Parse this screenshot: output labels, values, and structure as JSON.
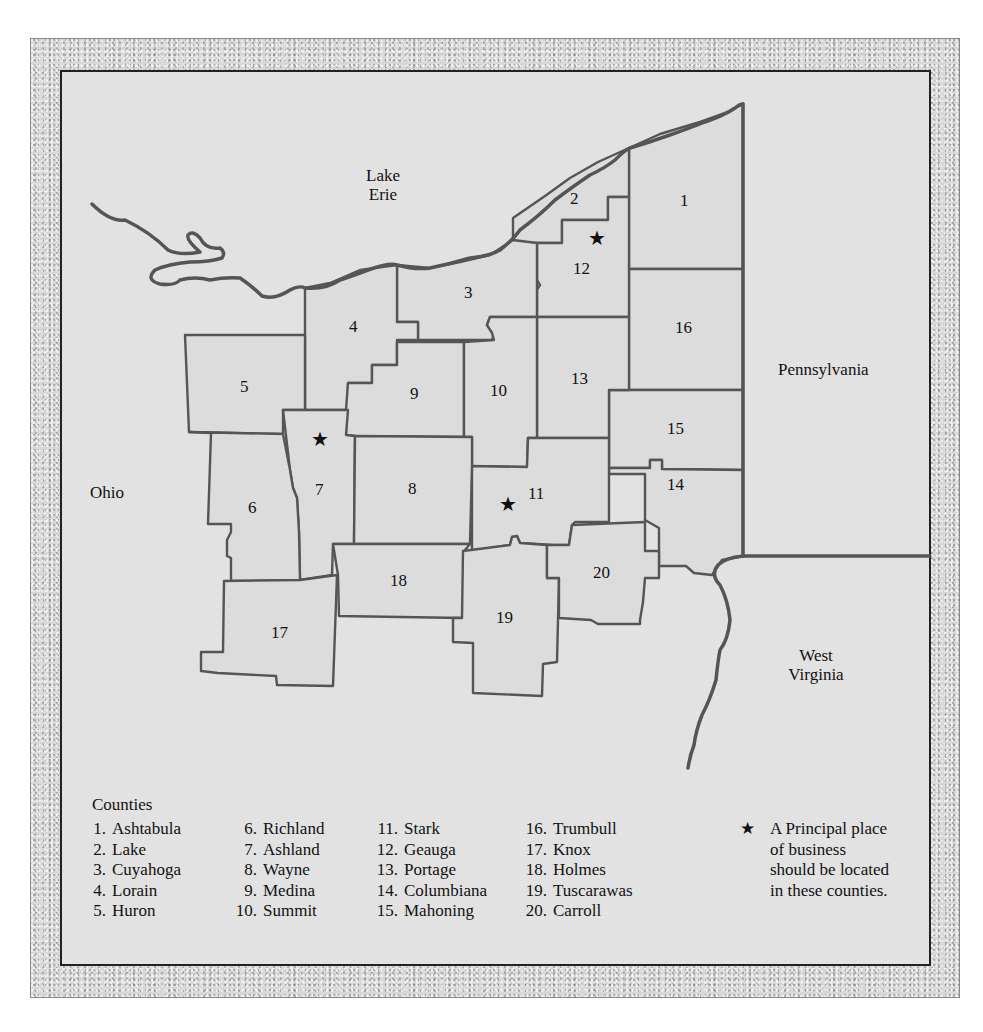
{
  "map": {
    "water_labels": [
      {
        "id": "lake-erie",
        "lines": [
          "Lake",
          "Erie"
        ]
      }
    ],
    "region_labels": {
      "ohio": "Ohio",
      "pennsylvania": "Pennsylvania",
      "west_virginia": [
        "West",
        "Virginia"
      ]
    },
    "county_numbers": [
      "1",
      "2",
      "3",
      "4",
      "5",
      "6",
      "7",
      "8",
      "9",
      "10",
      "11",
      "12",
      "13",
      "14",
      "15",
      "16",
      "17",
      "18",
      "19",
      "20"
    ],
    "star_symbol": "★",
    "starred_counties": [
      "7",
      "11",
      "12"
    ],
    "colors": {
      "panel_bg": "#e2e2e2",
      "county_fill": "#dcdcdc",
      "border_line": "#555555",
      "frame_border": "#222222"
    }
  },
  "legend": {
    "title": "Counties",
    "columns": [
      [
        {
          "num": "1.",
          "name": "Ashtabula"
        },
        {
          "num": "2.",
          "name": "Lake"
        },
        {
          "num": "3.",
          "name": "Cuyahoga"
        },
        {
          "num": "4.",
          "name": "Lorain"
        },
        {
          "num": "5.",
          "name": "Huron"
        }
      ],
      [
        {
          "num": "6.",
          "name": "Richland"
        },
        {
          "num": "7.",
          "name": "Ashland"
        },
        {
          "num": "8.",
          "name": "Wayne"
        },
        {
          "num": "9.",
          "name": "Medina"
        },
        {
          "num": "10.",
          "name": "Summit"
        }
      ],
      [
        {
          "num": "11.",
          "name": "Stark"
        },
        {
          "num": "12.",
          "name": "Geauga"
        },
        {
          "num": "13.",
          "name": "Portage"
        },
        {
          "num": "14.",
          "name": "Columbiana"
        },
        {
          "num": "15.",
          "name": "Mahoning"
        }
      ],
      [
        {
          "num": "16.",
          "name": "Trumbull"
        },
        {
          "num": "17.",
          "name": "Knox"
        },
        {
          "num": "18.",
          "name": "Holmes"
        },
        {
          "num": "19.",
          "name": "Tuscarawas"
        },
        {
          "num": "20.",
          "name": "Carroll"
        }
      ]
    ],
    "star_note": {
      "symbol": "★",
      "lines": [
        "A Principal place",
        "of business",
        "should be located",
        "in these counties."
      ]
    }
  }
}
